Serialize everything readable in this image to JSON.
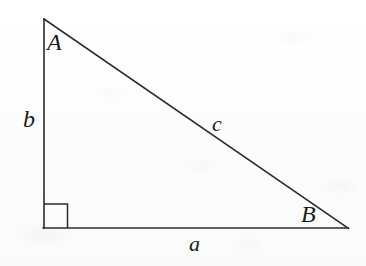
{
  "figure": {
    "kind": "right-triangle-diagram",
    "background_color": "#fdfdfd",
    "stroke_color": "#2b2b2b",
    "labels": {
      "vertex_a": "A",
      "vertex_b": "B",
      "side_a": "a",
      "side_b": "b",
      "side_c": "c"
    },
    "geometry": {
      "apex_point": "44,19",
      "right_angle_point": "44,228",
      "right_vertex_point": "348,228",
      "right_angle_marker_size": 24,
      "stroke_width": 1.5
    },
    "icons": {
      "right_angle_marker": "right-angle-marker-icon"
    }
  }
}
